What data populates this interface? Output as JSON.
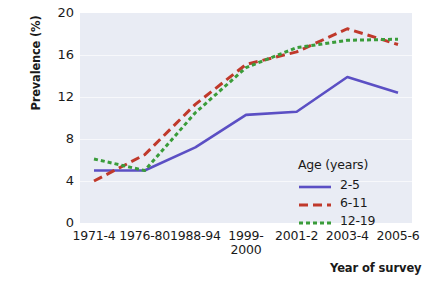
{
  "chart_data": {
    "type": "line",
    "title": "",
    "subtitle": "",
    "xlabel": "Year of survey",
    "ylabel": "Prevalence (%)",
    "categories": [
      "1971-4",
      "1976-80",
      "1988-94",
      "1999-\n2000",
      "2001-2",
      "2003-4",
      "2005-6"
    ],
    "ylim": [
      0,
      20
    ],
    "yticks": [
      "0",
      "4",
      "8",
      "12",
      "16",
      "20"
    ],
    "ytick_values": [
      0,
      4,
      8,
      12,
      16,
      20
    ],
    "grid": true,
    "legend_position": "inside-lower-right",
    "legend_title": "Age (years)",
    "series": [
      {
        "name": "2-5",
        "color": "#5b4fc4",
        "style": "solid",
        "values": [
          5.0,
          5.0,
          7.2,
          10.3,
          10.6,
          13.9,
          12.4
        ]
      },
      {
        "name": "6-11",
        "color": "#c0392b",
        "style": "dashed",
        "values": [
          4.0,
          6.5,
          11.3,
          15.1,
          16.3,
          18.5,
          17.0
        ]
      },
      {
        "name": "12-19",
        "color": "#3a9c3a",
        "style": "dotted",
        "values": [
          6.1,
          5.0,
          10.5,
          14.8,
          16.7,
          17.4,
          17.5
        ]
      }
    ]
  },
  "axes": {
    "y_title": "Prevalence (%)",
    "x_title": "Year of survey"
  },
  "legend": {
    "title": "Age (years)",
    "entries": [
      {
        "label": "2-5"
      },
      {
        "label": "6-11"
      },
      {
        "label": "12-19"
      }
    ]
  },
  "colors": {
    "plot_background": "#e9ecf4",
    "gridline": "#f7f8fb",
    "series_2_5": "#5b4fc4",
    "series_6_11": "#c0392b",
    "series_12_19": "#3a9c3a",
    "text": "#1a1a1a"
  }
}
